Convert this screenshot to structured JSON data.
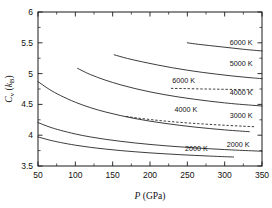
{
  "chart_data": {
    "type": "line",
    "title": "",
    "xlabel": "P (GPa)",
    "ylabel": "Cv (kB)",
    "xlabel_parts": {
      "italic": "P",
      "rest": " (GPa)"
    },
    "ylabel_parts": {
      "italic": "C",
      "sub": "v",
      "rest": " (",
      "italic2": "k",
      "sub2": "B",
      "rest2": ")"
    },
    "xlim": [
      50,
      350
    ],
    "ylim": [
      3.5,
      6
    ],
    "xticks": [
      50,
      100,
      150,
      200,
      250,
      300,
      350
    ],
    "xticks_minor": [
      75,
      125,
      175,
      225,
      275,
      325
    ],
    "yticks": [
      3.5,
      4,
      4.5,
      5,
      5.5,
      6
    ],
    "yticks_minor": [
      3.75,
      4.25,
      4.75,
      5.25,
      5.75
    ],
    "xtick_labels": [
      "50",
      "100",
      "150",
      "200",
      "250",
      "300",
      "350"
    ],
    "ytick_labels": [
      "3.5",
      "4",
      "4.5",
      "5",
      "5.5",
      "6"
    ],
    "grid": false,
    "legend_position": "inline-right",
    "series": [
      {
        "name": "6000 K (upper solid)",
        "label": "6000 K",
        "style": "solid",
        "label_x": 322,
        "label_y": 5.47,
        "points": [
          [
            250,
            5.5
          ],
          [
            265,
            5.475
          ],
          [
            280,
            5.455
          ],
          [
            295,
            5.435
          ],
          [
            310,
            5.415
          ],
          [
            325,
            5.395
          ],
          [
            340,
            5.378
          ],
          [
            350,
            5.368
          ]
        ]
      },
      {
        "name": "5000 K",
        "label": "5000 K",
        "style": "solid",
        "label_x": 322,
        "label_y": 5.12,
        "points": [
          [
            152,
            5.305
          ],
          [
            170,
            5.245
          ],
          [
            190,
            5.19
          ],
          [
            210,
            5.14
          ],
          [
            230,
            5.095
          ],
          [
            250,
            5.055
          ],
          [
            270,
            5.02
          ],
          [
            290,
            4.99
          ],
          [
            310,
            4.962
          ],
          [
            330,
            4.938
          ],
          [
            350,
            4.918
          ]
        ]
      },
      {
        "name": "6000 K (dashed)",
        "label": "6000 K",
        "style": "dashed",
        "label_x": 245,
        "label_y": 4.855,
        "points": [
          [
            228,
            4.76
          ],
          [
            245,
            4.757
          ],
          [
            265,
            4.752
          ],
          [
            285,
            4.748
          ],
          [
            305,
            4.744
          ],
          [
            325,
            4.74
          ],
          [
            340,
            4.737
          ]
        ]
      },
      {
        "name": "4000 K (upper solid)",
        "label": "4000 K",
        "style": "solid",
        "label_x": 322,
        "label_y": 4.66,
        "points": [
          [
            103,
            5.085
          ],
          [
            120,
            4.985
          ],
          [
            140,
            4.895
          ],
          [
            160,
            4.82
          ],
          [
            180,
            4.757
          ],
          [
            200,
            4.703
          ],
          [
            220,
            4.657
          ],
          [
            240,
            4.617
          ],
          [
            260,
            4.583
          ],
          [
            280,
            4.552
          ],
          [
            300,
            4.525
          ],
          [
            320,
            4.502
          ],
          [
            350,
            4.474
          ]
        ]
      },
      {
        "name": "3000 K",
        "label": "3000 K",
        "style": "solid",
        "label_x": 322,
        "label_y": 4.285,
        "points": [
          [
            50,
            4.87
          ],
          [
            65,
            4.745
          ],
          [
            80,
            4.645
          ],
          [
            100,
            4.535
          ],
          [
            120,
            4.448
          ],
          [
            140,
            4.378
          ],
          [
            160,
            4.32
          ],
          [
            180,
            4.27
          ],
          [
            200,
            4.228
          ],
          [
            220,
            4.192
          ],
          [
            240,
            4.16
          ],
          [
            260,
            4.132
          ],
          [
            280,
            4.108
          ],
          [
            300,
            4.086
          ],
          [
            320,
            4.068
          ],
          [
            333,
            4.057
          ]
        ]
      },
      {
        "name": "4000 K (dashed)",
        "label": "4000 K",
        "style": "dashed",
        "label_x": 248,
        "label_y": 4.375,
        "points": [
          [
            168,
            4.305
          ],
          [
            185,
            4.276
          ],
          [
            205,
            4.248
          ],
          [
            225,
            4.224
          ],
          [
            245,
            4.204
          ],
          [
            265,
            4.187
          ],
          [
            285,
            4.172
          ],
          [
            305,
            4.158
          ],
          [
            325,
            4.146
          ],
          [
            340,
            4.138
          ]
        ]
      },
      {
        "name": "2000 K (upper)",
        "label": "2000 K",
        "style": "solid",
        "label_x": 318,
        "label_y": 3.815,
        "points": [
          [
            50,
            4.205
          ],
          [
            65,
            4.135
          ],
          [
            80,
            4.08
          ],
          [
            100,
            4.02
          ],
          [
            120,
            3.972
          ],
          [
            140,
            3.934
          ],
          [
            160,
            3.902
          ],
          [
            180,
            3.874
          ],
          [
            200,
            3.85
          ],
          [
            220,
            3.829
          ],
          [
            240,
            3.811
          ],
          [
            260,
            3.794
          ],
          [
            280,
            3.78
          ],
          [
            300,
            3.767
          ],
          [
            320,
            3.755
          ],
          [
            350,
            3.74
          ]
        ]
      },
      {
        "name": "2000 K (lower)",
        "label": "2000 K",
        "style": "solid",
        "label_x": 262,
        "label_y": 3.745,
        "points": [
          [
            50,
            3.972
          ],
          [
            65,
            3.922
          ],
          [
            80,
            3.882
          ],
          [
            100,
            3.838
          ],
          [
            120,
            3.803
          ],
          [
            140,
            3.775
          ],
          [
            160,
            3.751
          ],
          [
            180,
            3.731
          ],
          [
            200,
            3.713
          ],
          [
            220,
            3.698
          ],
          [
            240,
            3.684
          ],
          [
            260,
            3.672
          ],
          [
            280,
            3.661
          ],
          [
            300,
            3.651
          ],
          [
            312,
            3.646
          ]
        ]
      }
    ]
  }
}
